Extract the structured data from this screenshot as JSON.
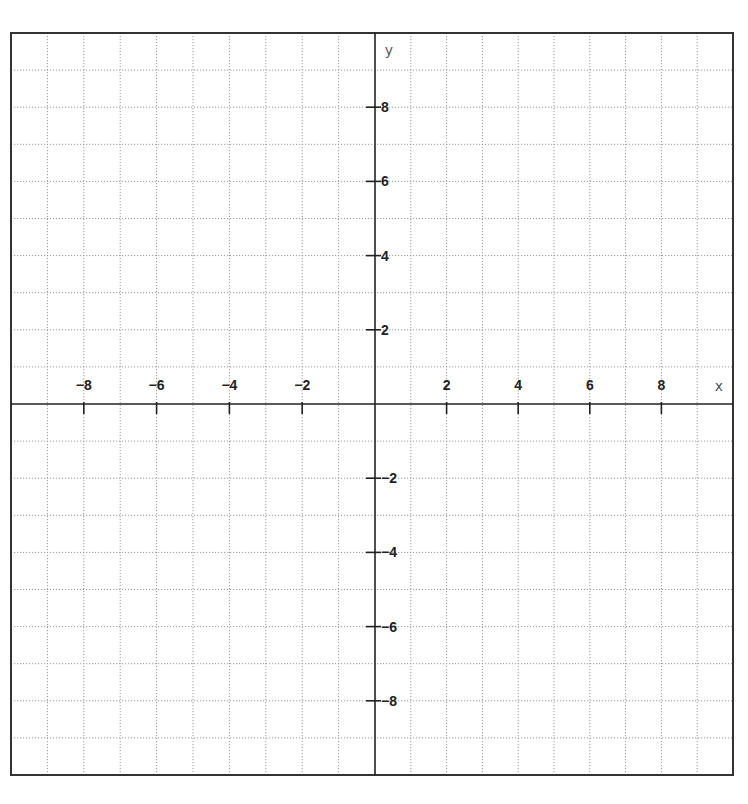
{
  "chart_data": {
    "type": "coordinate-grid",
    "title": "",
    "xlabel": "x",
    "ylabel": "y",
    "xlim": [
      -10,
      10
    ],
    "ylim": [
      -10,
      10
    ],
    "grid": true,
    "grid_style": "dotted",
    "grid_step": 1,
    "x_ticks": [
      -8,
      -6,
      -4,
      -2,
      2,
      4,
      6,
      8
    ],
    "y_ticks": [
      8,
      6,
      4,
      2,
      -2,
      -4,
      -6,
      -8
    ],
    "x_tick_labels": [
      "-8",
      "-6",
      "-4",
      "-2",
      "2",
      "4",
      "6",
      "8"
    ],
    "y_tick_labels": [
      "8",
      "6",
      "4",
      "2",
      "-2",
      "-4",
      "-6",
      "-8"
    ],
    "series": [],
    "legend": null
  },
  "layout": {
    "frame": {
      "left": 11,
      "top": 33,
      "right": 733,
      "bottom": 775
    },
    "origin": {
      "x": 375,
      "y": 404
    },
    "colors": {
      "axis": "#222222",
      "grid": "#9a9a9a",
      "frame": "#333333",
      "label": "#222222",
      "axis_name": "#555555"
    }
  },
  "labels": {
    "x_axis": "x",
    "y_axis": "y"
  }
}
